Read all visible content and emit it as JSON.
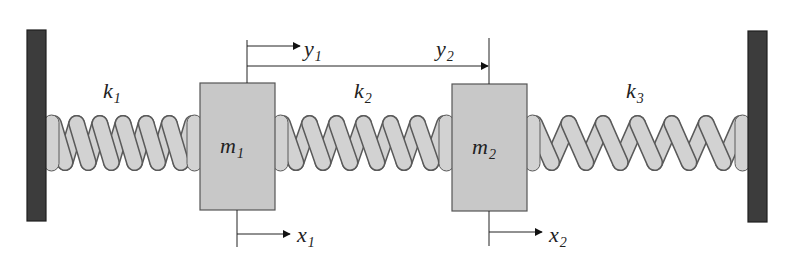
{
  "diagram": {
    "colors": {
      "wall": "#3c3c3c",
      "wall_stroke": "#1e1e1e",
      "mass_fill": "#c8c8c8",
      "mass_stroke": "#555555",
      "spring_fill": "#d2d2d2",
      "spring_stroke": "#5a5a5a",
      "line": "#222222"
    },
    "walls": [
      {
        "id": "left-wall",
        "x": 27,
        "y": 30,
        "w": 19,
        "h": 191
      },
      {
        "id": "right-wall",
        "x": 748,
        "y": 31,
        "w": 19,
        "h": 191
      }
    ],
    "masses": [
      {
        "id": "m1",
        "label": "m",
        "sub": "1",
        "x": 200,
        "y": 83,
        "w": 75,
        "h": 127
      },
      {
        "id": "m2",
        "label": "m",
        "sub": "2",
        "x": 452,
        "y": 84,
        "w": 75,
        "h": 127
      }
    ],
    "springs": [
      {
        "id": "k1",
        "label": "k",
        "sub": "1",
        "x1": 46,
        "x2": 200,
        "coils": 6,
        "label_x": 103,
        "label_y": 98
      },
      {
        "id": "k2",
        "label": "k",
        "sub": "2",
        "x1": 275,
        "x2": 452,
        "coils": 6,
        "label_x": 354,
        "label_y": 98
      },
      {
        "id": "k3",
        "label": "k",
        "sub": "3",
        "x1": 527,
        "x2": 748,
        "coils": 6,
        "label_x": 626,
        "label_y": 98
      }
    ],
    "displacements": [
      {
        "id": "y1",
        "label": "y",
        "sub": "1",
        "ref_x": 247,
        "line_y": 46,
        "tip_x": 300,
        "label_x": 304,
        "label_y": 56
      },
      {
        "id": "y2",
        "label": "y",
        "sub": "2",
        "ref_x": 247,
        "line_y": 66,
        "tip_x": 488,
        "label_x": 436,
        "label_y": 56
      },
      {
        "id": "x1",
        "label": "x",
        "sub": "1",
        "ref_x": 237,
        "line_y": 234,
        "tip_x": 290,
        "label_x": 297,
        "label_y": 242
      },
      {
        "id": "x2",
        "label": "x",
        "sub": "2",
        "ref_x": 489,
        "line_y": 232,
        "tip_x": 542,
        "label_x": 549,
        "label_y": 242
      }
    ],
    "guides": [
      {
        "id": "m1-top-guide",
        "x": 247,
        "y1": 40,
        "y2": 83
      },
      {
        "id": "m2-top-guide",
        "x": 489,
        "y1": 38,
        "y2": 84
      },
      {
        "id": "m1-bottom-guide",
        "x": 237,
        "y1": 210,
        "y2": 247
      },
      {
        "id": "m2-bottom-guide",
        "x": 489,
        "y1": 211,
        "y2": 246
      }
    ]
  }
}
